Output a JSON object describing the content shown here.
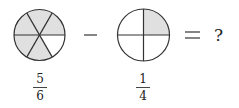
{
  "equation": {
    "left": {
      "circle": {
        "parts": 6,
        "shaded": 5,
        "unshaded_sector": "bottom-right"
      },
      "fraction": {
        "numerator": "5",
        "denominator": "6"
      }
    },
    "operator": "−",
    "right": {
      "circle": {
        "parts": 4,
        "shaded": 1,
        "shaded_sector": "top-right"
      },
      "fraction": {
        "numerator": "1",
        "denominator": "4"
      }
    },
    "equals": "=",
    "result": "?"
  },
  "colors": {
    "shade": "#e0e0e0",
    "stroke": "#333333",
    "background": "#ffffff"
  }
}
